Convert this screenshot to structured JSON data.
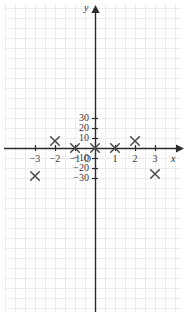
{
  "chart_data": {
    "type": "scatter",
    "title": "",
    "xlabel": "x",
    "ylabel": "y",
    "xlim": [
      -3.9,
      4.0
    ],
    "ylim": [
      -36,
      34
    ],
    "grid": true,
    "legend": null,
    "marker": "x",
    "marker_color": "#4a4a4a",
    "axis_color": "#2b2b2b",
    "grid_color": "#f2eaea",
    "origin_label": "O",
    "xticks": [
      -3,
      -2,
      -1,
      1,
      2,
      3
    ],
    "xtick_labels": [
      "−3",
      "−2",
      "−1",
      "1",
      "2",
      "3"
    ],
    "yticks": [
      30,
      20,
      10,
      -10,
      -20,
      -30
    ],
    "ytick_labels": [
      "30",
      "20",
      "10",
      "−10",
      "−20",
      "−30"
    ],
    "points": [
      {
        "x": -3,
        "y": -28
      },
      {
        "x": -2,
        "y": 7
      },
      {
        "x": -1,
        "y": 0
      },
      {
        "x": 0,
        "y": 0
      },
      {
        "x": 1,
        "y": 0
      },
      {
        "x": 2,
        "y": 7
      },
      {
        "x": 3,
        "y": -26
      }
    ]
  },
  "axes": {
    "x_axis_name": "x",
    "y_axis_name": "y"
  }
}
